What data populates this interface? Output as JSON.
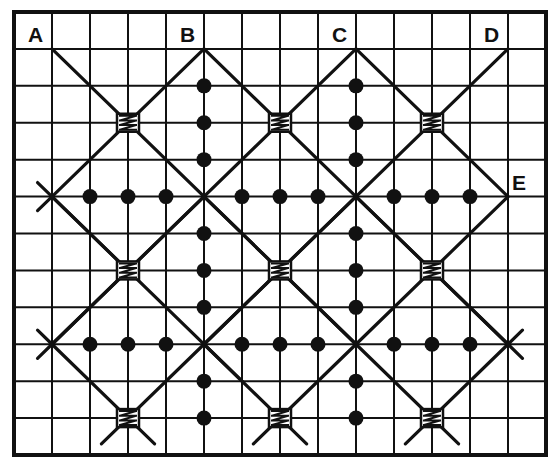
{
  "diagram": {
    "grid": {
      "columns": 14,
      "rows": 12
    },
    "colors": {
      "ink": "#111111",
      "background": "#ffffff"
    },
    "labels": [
      {
        "text": "A",
        "col": 1,
        "row": 1,
        "anchor": "above-left"
      },
      {
        "text": "B",
        "col": 5,
        "row": 1,
        "anchor": "above-left"
      },
      {
        "text": "C",
        "col": 9,
        "row": 1,
        "anchor": "above-left"
      },
      {
        "text": "D",
        "col": 13,
        "row": 1,
        "anchor": "above-left"
      },
      {
        "text": "E",
        "col": 13,
        "row": 5,
        "anchor": "above-right"
      }
    ],
    "diagonal_lines": [
      {
        "from": [
          1,
          1
        ],
        "to": [
          9,
          9
        ]
      },
      {
        "from": [
          5,
          1
        ],
        "to": [
          13,
          9
        ]
      },
      {
        "from": [
          9,
          1
        ],
        "to": [
          13,
          5
        ]
      },
      {
        "from": [
          5,
          1
        ],
        "to": [
          1,
          5
        ]
      },
      {
        "from": [
          9,
          1
        ],
        "to": [
          1,
          9
        ]
      },
      {
        "from": [
          13,
          1
        ],
        "to": [
          5,
          9
        ]
      },
      {
        "from": [
          13,
          5
        ],
        "to": [
          9,
          9
        ]
      },
      {
        "from": [
          1,
          5
        ],
        "to": [
          3,
          7
        ]
      },
      {
        "from": [
          1,
          5
        ],
        "to": [
          6,
          10
        ]
      },
      {
        "from": [
          1,
          9
        ],
        "to": [
          3.7,
          11.7
        ]
      },
      {
        "from": [
          5,
          9
        ],
        "to": [
          2.3,
          11.7
        ]
      },
      {
        "from": [
          5,
          9
        ],
        "to": [
          7.7,
          11.7
        ]
      },
      {
        "from": [
          9,
          9
        ],
        "to": [
          6.3,
          11.7
        ]
      },
      {
        "from": [
          9,
          9
        ],
        "to": [
          11.7,
          11.7
        ]
      },
      {
        "from": [
          13,
          9
        ],
        "to": [
          10.3,
          11.7
        ]
      },
      {
        "from": [
          5,
          5
        ],
        "to": [
          9,
          9
        ]
      },
      {
        "from": [
          9,
          5
        ],
        "to": [
          13,
          9
        ]
      },
      {
        "from": [
          9,
          5
        ],
        "to": [
          5,
          9
        ]
      },
      {
        "from": [
          5,
          5
        ],
        "to": [
          1,
          9
        ]
      }
    ],
    "x_marks": [
      {
        "col": 1,
        "row": 5
      },
      {
        "col": 1,
        "row": 9
      },
      {
        "col": 13,
        "row": 9
      }
    ],
    "wraps": [
      {
        "col": 3,
        "row": 3
      },
      {
        "col": 7,
        "row": 3
      },
      {
        "col": 11,
        "row": 3
      },
      {
        "col": 3,
        "row": 7
      },
      {
        "col": 7,
        "row": 7
      },
      {
        "col": 11,
        "row": 7
      },
      {
        "col": 3,
        "row": 11
      },
      {
        "col": 7,
        "row": 11
      },
      {
        "col": 11,
        "row": 11
      }
    ],
    "dots": [
      {
        "col": 5,
        "row": 2
      },
      {
        "col": 5,
        "row": 3
      },
      {
        "col": 5,
        "row": 4
      },
      {
        "col": 5,
        "row": 6
      },
      {
        "col": 5,
        "row": 7
      },
      {
        "col": 5,
        "row": 8
      },
      {
        "col": 5,
        "row": 10
      },
      {
        "col": 5,
        "row": 11
      },
      {
        "col": 9,
        "row": 2
      },
      {
        "col": 9,
        "row": 3
      },
      {
        "col": 9,
        "row": 4
      },
      {
        "col": 9,
        "row": 6
      },
      {
        "col": 9,
        "row": 7
      },
      {
        "col": 9,
        "row": 8
      },
      {
        "col": 9,
        "row": 10
      },
      {
        "col": 9,
        "row": 11
      },
      {
        "col": 2,
        "row": 5
      },
      {
        "col": 3,
        "row": 5
      },
      {
        "col": 4,
        "row": 5
      },
      {
        "col": 6,
        "row": 5
      },
      {
        "col": 7,
        "row": 5
      },
      {
        "col": 8,
        "row": 5
      },
      {
        "col": 10,
        "row": 5
      },
      {
        "col": 11,
        "row": 5
      },
      {
        "col": 12,
        "row": 5
      },
      {
        "col": 2,
        "row": 9
      },
      {
        "col": 3,
        "row": 9
      },
      {
        "col": 4,
        "row": 9
      },
      {
        "col": 6,
        "row": 9
      },
      {
        "col": 7,
        "row": 9
      },
      {
        "col": 8,
        "row": 9
      },
      {
        "col": 10,
        "row": 9
      },
      {
        "col": 11,
        "row": 9
      },
      {
        "col": 12,
        "row": 9
      }
    ]
  }
}
